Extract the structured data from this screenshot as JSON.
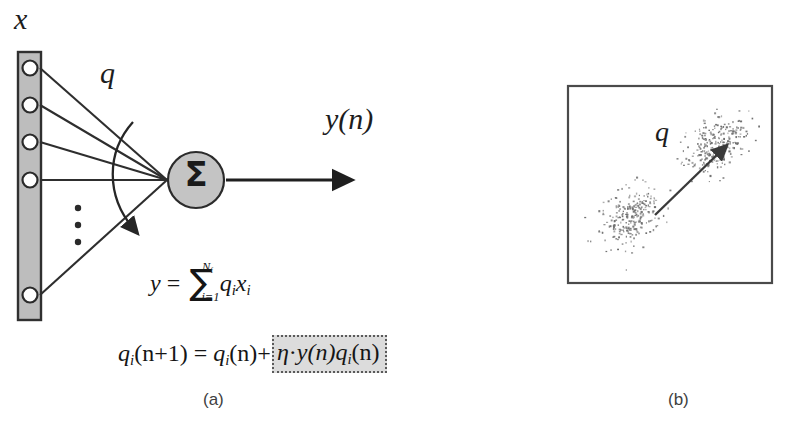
{
  "panel_a": {
    "caption": "(a)",
    "input_label": "x",
    "weight_label": "q",
    "output_label": "y(n)",
    "sum_symbol": "Σ",
    "input_nodes_count": 5,
    "vertical_dots": "⋮",
    "equations": {
      "output_eq": {
        "lhs": "y",
        "equals": "=",
        "sum_symbol": "∑",
        "sum_upper": "N",
        "sum_upper_sub": "f",
        "sum_lower": "i=1",
        "term_q": "q",
        "term_q_sub": "i",
        "term_x": "x",
        "term_x_sub": "i",
        "plain": "y = ∑(i=1..Nf) q_i x_i"
      },
      "update_eq": {
        "lhs_q": "q",
        "lhs_sub": "i",
        "lhs_arg": "(n+1)",
        "equals": "=",
        "rhs_q": "q",
        "rhs_sub": "i",
        "rhs_arg": "(n)",
        "plus": "+",
        "highlight": {
          "eta": "η",
          "dot": "·",
          "y_arg": "y(n)",
          "q": "q",
          "q_sub": "i",
          "q_arg": "(n)",
          "plain": "η · y(n) q_i(n)"
        },
        "plain": "q_i(n+1) = q_i(n) + η · y(n) q_i(n)"
      }
    }
  },
  "panel_b": {
    "caption": "(b)",
    "weight_vector_label": "q",
    "clusters": [
      {
        "name": "lower-left-cluster",
        "center_x": 0.3,
        "center_y": 0.66,
        "points": 260
      },
      {
        "name": "upper-right-cluster",
        "center_x": 0.72,
        "center_y": 0.3,
        "points": 260
      }
    ],
    "arrow": {
      "from_x": 0.3,
      "from_y": 0.66,
      "to_x": 0.72,
      "to_y": 0.3
    }
  },
  "colors": {
    "ink": "#1d1d1d",
    "stroke": "#4a4a4a",
    "bar_fill": "#bdbdbd",
    "node_fill": "#c4c4c4",
    "highlight_fill": "#dcdcdc",
    "highlight_border": "#5a5a5a",
    "point_color": "#6e6e6e",
    "background": "#ffffff"
  }
}
